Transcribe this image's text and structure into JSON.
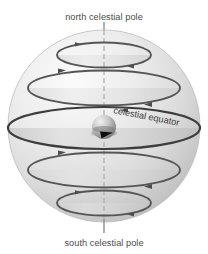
{
  "figure": {
    "title_visible": false,
    "background_color": "#ffffff",
    "labels": {
      "north_pole": "north celestial pole",
      "south_pole": "south celestial pole",
      "equator": "celestial equator"
    },
    "colors": {
      "sphere_light": "#f2f2f2",
      "sphere_mid": "#d8d8d8",
      "sphere_dark": "#b4b4b4",
      "circle_stroke": "#4a4a4a",
      "axis_stroke": "#9b9b9b",
      "leader_stroke": "#8c8c8c",
      "earth_light": "#e8e8e8",
      "earth_dark": "#7c7c7c",
      "arrow_fill": "#111111",
      "text_color": "#4c4c4c"
    },
    "sphere": {
      "cx": 104,
      "cy": 126,
      "r": 96
    },
    "axis": {
      "x": 104,
      "y_top": 22,
      "y_bottom": 241
    },
    "earth": {
      "cx": 104,
      "cy": 127,
      "r": 12
    },
    "latitude_circles": [
      {
        "name": "north-mid-latitude-circle",
        "cy": 55,
        "rx": 47,
        "ry": 12.5,
        "arrow_top_x": 78,
        "arrow_bottom_x": 132
      },
      {
        "name": "north-low-latitude-circle",
        "cy": 88,
        "rx": 76,
        "ry": 17.5,
        "arrow_top_x": 62,
        "arrow_bottom_x": 150
      },
      {
        "name": "celestial-equator-circle",
        "cy": 128,
        "rx": 96,
        "ry": 21.0,
        "arrow_top_x": 0,
        "arrow_bottom_x": 0
      },
      {
        "name": "south-low-latitude-circle",
        "cy": 170,
        "rx": 76,
        "ry": 17.5,
        "arrow_top_x": 62,
        "arrow_bottom_x": 150
      },
      {
        "name": "south-mid-latitude-circle",
        "cy": 203,
        "rx": 47,
        "ry": 12.5,
        "arrow_top_x": 78,
        "arrow_bottom_x": 132
      }
    ],
    "leader_lines": [
      {
        "name": "north-pole-leader",
        "x": 104,
        "y1": 22,
        "y2": 33
      },
      {
        "name": "south-pole-leader",
        "x": 104,
        "y1": 219,
        "y2": 232
      }
    ]
  }
}
